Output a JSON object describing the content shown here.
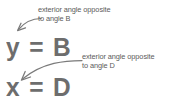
{
  "figure": {
    "background_color": "#ffffff",
    "text_color": "#5b5b5b",
    "equation_color": "#6d6d6d",
    "arrow_color": "#7a7a7a"
  },
  "annotations": [
    {
      "id": "annotation-b",
      "line1": "exterior angle opposite",
      "line2": "to angle B",
      "points_to": "y"
    },
    {
      "id": "annotation-d",
      "line1": "exterior angle opposite",
      "line2": "to angle D",
      "points_to": "x"
    }
  ],
  "equations": [
    {
      "id": "equation-y",
      "text": "y = B",
      "left": "y",
      "operator": "=",
      "right": "B"
    },
    {
      "id": "equation-x",
      "text": "x = D",
      "left": "x",
      "operator": "=",
      "right": "D"
    }
  ],
  "arrows": [
    {
      "id": "arrow-to-y",
      "direction": "down-left",
      "target": "y"
    },
    {
      "id": "arrow-to-x",
      "direction": "left",
      "target": "x"
    }
  ]
}
